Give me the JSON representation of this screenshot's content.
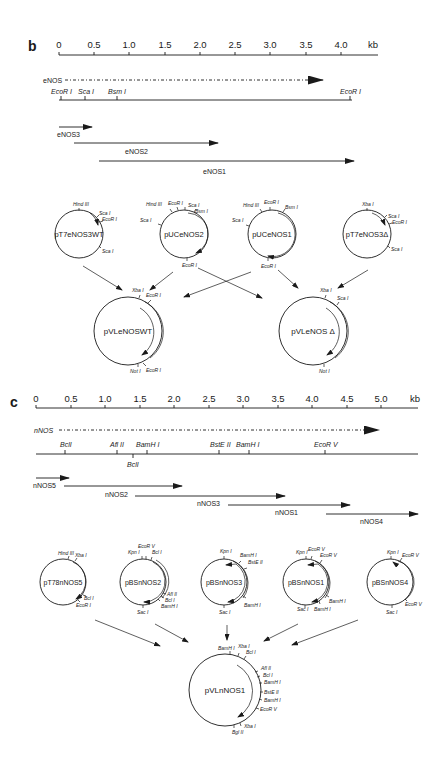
{
  "panel_b": {
    "label": "b",
    "scale": {
      "ticks": [
        "0",
        "0.5",
        "1.0",
        "1.5",
        "2.0",
        "2.5",
        "3.0",
        "3.5",
        "4.0"
      ],
      "unit": "kb"
    },
    "gene": "eNOS",
    "sites": [
      {
        "name": "EcoR I",
        "kb": 0.0
      },
      {
        "name": "Sca I",
        "kb": 0.35
      },
      {
        "name": "Bsm I",
        "kb": 0.8
      },
      {
        "name": "EcoR I",
        "kb": 4.1
      }
    ],
    "clones": [
      {
        "name": "eNOS3",
        "start_kb": 0.0,
        "end_kb": 0.45
      },
      {
        "name": "eNOS2",
        "start_kb": 0.25,
        "end_kb": 2.3
      },
      {
        "name": "eNOS1",
        "start_kb": 0.6,
        "end_kb": 4.25
      }
    ],
    "plasmids": [
      {
        "name": "pT7eNOS3WT",
        "sites": [
          "Hind III",
          "Sca I",
          "EcoR I",
          "Sca I"
        ]
      },
      {
        "name": "pUCeNOS2",
        "sites": [
          "Hind III",
          "EcoR I",
          "Sca I",
          "Bsm I",
          "Sca I",
          "EcoR I"
        ]
      },
      {
        "name": "pUCeNOS1",
        "sites": [
          "Hind III",
          "EcoR I",
          "Bsm I",
          "Sca I",
          "EcoR I"
        ]
      },
      {
        "name": "pT7eNOS3Δ",
        "sites": [
          "Xba I",
          "Sca I",
          "EcoR I",
          "Sca I"
        ]
      }
    ],
    "products": [
      {
        "name": "pVLeNOSWT",
        "sites": [
          "Xba I",
          "EcoR I",
          "Not I",
          "EcoR I"
        ]
      },
      {
        "name": "pVLeNOS Δ",
        "sites": [
          "Xba I",
          "Sca I",
          "Not I"
        ]
      }
    ]
  },
  "panel_c": {
    "label": "c",
    "scale": {
      "ticks": [
        "0",
        "0.5",
        "1.0",
        "1.5",
        "2.0",
        "2.5",
        "3.0",
        "3.5",
        "4.0",
        "4.5",
        "5.0"
      ],
      "unit": "kb"
    },
    "gene": "nNOS",
    "sites": [
      {
        "name": "BclI",
        "kb": 0.42,
        "pos": "above"
      },
      {
        "name": "Afl II",
        "kb": 1.18,
        "pos": "above"
      },
      {
        "name": "BclI",
        "kb": 1.4,
        "pos": "below"
      },
      {
        "name": "BamH I",
        "kb": 1.6,
        "pos": "above"
      },
      {
        "name": "BstE II",
        "kb": 2.65,
        "pos": "above"
      },
      {
        "name": "BamH I",
        "kb": 3.1,
        "pos": "above"
      },
      {
        "name": "EcoR V",
        "kb": 4.2,
        "pos": "above"
      }
    ],
    "clones": [
      {
        "name": "nNOS5",
        "start_kb": 0.0,
        "end_kb": 0.45
      },
      {
        "name": "nNOS2",
        "start_kb": 0.4,
        "end_kb": 2.1
      },
      {
        "name": "nNOS3",
        "start_kb": 1.45,
        "end_kb": 3.55
      },
      {
        "name": "nNOS1",
        "start_kb": 2.8,
        "end_kb": 4.5
      },
      {
        "name": "nNOS4",
        "start_kb": 4.2,
        "end_kb": 5.4
      }
    ],
    "plasmids": [
      {
        "name": "pT78nNOS5",
        "sites": [
          "Hind III",
          "Xba I",
          "Bcl I",
          "EcoR I"
        ]
      },
      {
        "name": "pBSnNOS2",
        "sites": [
          "EcoR V",
          "Kpn I",
          "Bcl I",
          "Afl II",
          "Bcl I",
          "BamH I",
          "Sac I"
        ]
      },
      {
        "name": "pBSnNOS3",
        "sites": [
          "Kpn I",
          "BamH I",
          "BstE II",
          "BamH I",
          "Sac I"
        ]
      },
      {
        "name": "pBSnNOS1",
        "sites": [
          "Kpn I",
          "EcoR V",
          "EcoR V",
          "BamH I",
          "BamH I",
          "Sac I"
        ]
      },
      {
        "name": "pBSnNOS4",
        "sites": [
          "Kpn I",
          "EcoR V",
          "EcoR V",
          "Sac I"
        ]
      }
    ],
    "product": {
      "name": "pVLnNOS1",
      "sites": [
        "BamH I",
        "Xba I",
        "Bcl I",
        "Afl II",
        "Bcl I",
        "BamH I",
        "BstE II",
        "BamH I",
        "EcoR V",
        "Xba I",
        "Bgl II"
      ]
    }
  }
}
